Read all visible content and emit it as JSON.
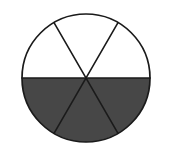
{
  "figure": {
    "shape": "circle",
    "total_sectors": 6,
    "shaded_sectors": 3,
    "fraction_label": "3/6",
    "simplified_fraction": "1/2",
    "colors": {
      "shaded_fill": "#474747",
      "unshaded_fill": "#ffffff",
      "outline": "#1a1a1a",
      "background": "#ffffff"
    },
    "geometry": {
      "center_x": 86,
      "center_y": 78,
      "radius": 64,
      "sector_angle_degrees": 60,
      "diameter_angles_degrees": [
        0,
        60,
        120
      ]
    },
    "sectors": [
      {
        "index": 1,
        "start_angle": 0,
        "end_angle": 60,
        "shaded": false,
        "position": "upper-right"
      },
      {
        "index": 2,
        "start_angle": 60,
        "end_angle": 120,
        "shaded": false,
        "position": "top"
      },
      {
        "index": 3,
        "start_angle": 120,
        "end_angle": 180,
        "shaded": false,
        "position": "upper-left"
      },
      {
        "index": 4,
        "start_angle": 180,
        "end_angle": 240,
        "shaded": true,
        "position": "lower-left"
      },
      {
        "index": 5,
        "start_angle": 240,
        "end_angle": 300,
        "shaded": true,
        "position": "bottom"
      },
      {
        "index": 6,
        "start_angle": 300,
        "end_angle": 360,
        "shaded": true,
        "position": "lower-right"
      }
    ],
    "dividers": [
      {
        "name": "horizontal-diameter",
        "x1": 22,
        "y1": 78,
        "x2": 150,
        "y2": 78
      },
      {
        "name": "diameter-60-degrees",
        "x1": 54,
        "y1": 22.6,
        "x2": 118,
        "y2": 133.4
      },
      {
        "name": "diameter-120-degrees",
        "x1": 118,
        "y1": 22.6,
        "x2": 54,
        "y2": 133.4
      }
    ]
  }
}
